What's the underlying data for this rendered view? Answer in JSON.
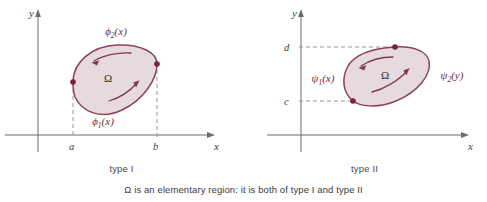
{
  "figure": {
    "caption": "Ω is an elementary region: it is both of type I and type II",
    "region_symbol": "Ω",
    "fill_color": "#e3d3d8",
    "stroke_color": "#8d4258",
    "dot_color": "#7b2138",
    "axis_color": "#6d6d6d",
    "dash_color": "#8d8d8d"
  },
  "panels": [
    {
      "id": "type-i",
      "caption": "type I",
      "axis_x_label": "x",
      "axis_y_label": "y",
      "region_label": "Ω",
      "tick_labels": [
        "a",
        "b"
      ],
      "curve_upper_base": "ϕ",
      "curve_upper_sub": "2",
      "curve_upper_arg": "(x)",
      "curve_lower_base": "ϕ",
      "curve_lower_sub": "1",
      "curve_lower_arg": "(x)"
    },
    {
      "id": "type-ii",
      "caption": "type II",
      "axis_x_label": "x",
      "axis_y_label": "y",
      "region_label": "Ω",
      "tick_labels": [
        "d",
        "c"
      ],
      "curve_left_base": "ψ",
      "curve_left_sub": "1",
      "curve_left_arg": "(x)",
      "curve_right_base": "ψ",
      "curve_right_sub": "2",
      "curve_right_arg": "(y)"
    }
  ]
}
